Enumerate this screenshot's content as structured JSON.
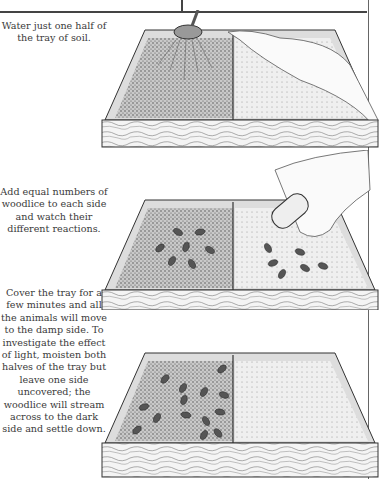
{
  "page": {
    "steps": [
      {
        "caption": "Water just one half of the tray of soil.",
        "illustration": "tray-watering-can-cloth"
      },
      {
        "caption": "Add equal numbers of woodlice to each side and watch their different reactions.",
        "illustration": "tray-hand-adding-woodlice"
      },
      {
        "caption": "Cover the tray for a few minutes and all the animals will move to the damp side. To investigate the effect of light, moisten both halves of the tray but leave one side uncovered; the woodlice will stream across to the dark side and settle down.",
        "illustration": "tray-woodlice-gathered-one-side"
      }
    ]
  }
}
